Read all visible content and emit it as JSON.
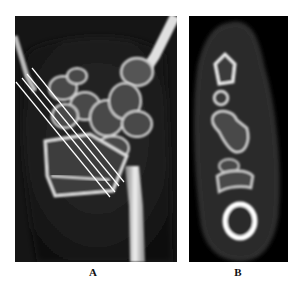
{
  "figure": {
    "panels": [
      {
        "id": "A",
        "label": "A",
        "description": "Coronal CT of wrist with four oblique reference lines"
      },
      {
        "id": "B",
        "label": "B",
        "description": "Axial/oblique CT cross-section of carpal bones"
      }
    ],
    "reference_lines": {
      "count": 4,
      "color": "#ffffff"
    },
    "colors": {
      "background": "#ffffff",
      "panel_bg": "#000000",
      "bone": "#e8e8e8",
      "label": "#111111"
    }
  }
}
